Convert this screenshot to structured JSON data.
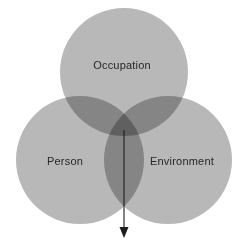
{
  "diagram": {
    "type": "venn-3-circle",
    "background_color": "#ffffff",
    "circle_fill": "#b8b8b8",
    "circle_opacity": 1,
    "overlap_pair_color": "#9a9a9a",
    "overlap_triple_color": "#7e7e7e",
    "label_color": "#27272b",
    "arrow_color": "#1c1c1c",
    "circles": [
      {
        "id": "occupation",
        "label": "Occupation",
        "cx": 124,
        "cy": 72,
        "r": 64,
        "label_x": 122,
        "label_y": 66
      },
      {
        "id": "person",
        "label": "Person",
        "cx": 80,
        "cy": 160,
        "r": 64,
        "label_x": 65,
        "label_y": 162
      },
      {
        "id": "environment",
        "label": "Environment",
        "cx": 168,
        "cy": 160,
        "r": 64,
        "label_x": 182,
        "label_y": 162
      }
    ],
    "arrow": {
      "label": "",
      "x": 124,
      "y_start": 130,
      "y_end": 238,
      "head_width": 9,
      "head_length": 11,
      "stroke_width": 1.1
    }
  }
}
